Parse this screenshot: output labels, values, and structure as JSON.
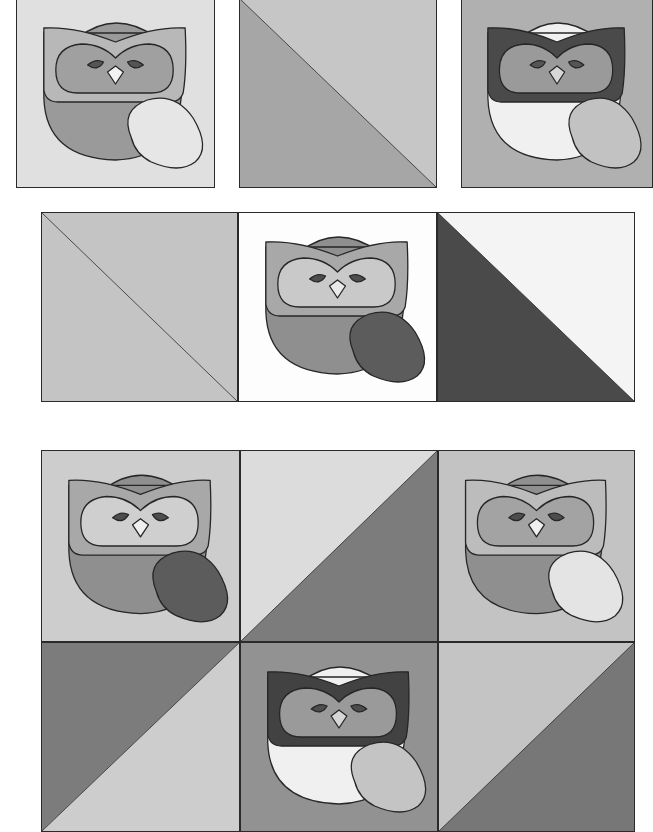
{
  "page": {
    "width": 651,
    "height": 825,
    "background": "#ffffff"
  },
  "palette": {
    "line": "#262626",
    "white": "#fbfbfb",
    "very_light": "#e4e4e4",
    "light": "#d0d0d0",
    "light_mid": "#bdbdbd",
    "mid": "#a9a9a9",
    "mid_dark": "#8e8e8e",
    "dark": "#6e6e6e",
    "darker": "#4a4a4a"
  },
  "sections": [
    {
      "name": "top-row",
      "blocks": [
        {
          "id": "top-1",
          "type": "owl",
          "x": 16,
          "y": -2,
          "w": 199,
          "h": 190,
          "bg": "#e0e0e0",
          "body": "#9a9a9a",
          "head_top": "#9a9a9a",
          "mask": "#b8b8b8",
          "face": "#a0a0a0",
          "eyes": "#555555",
          "beak": "#f2f2f2",
          "wing": "#e6e6e6"
        },
        {
          "id": "top-2",
          "type": "hst",
          "x": 239,
          "y": -2,
          "w": 198,
          "h": 190,
          "diagonal": "tl-br",
          "upper": "#c6c6c6",
          "lower": "#a6a6a6"
        },
        {
          "id": "top-3",
          "type": "owl",
          "x": 461,
          "y": -2,
          "w": 192,
          "h": 190,
          "bg": "#b0b0b0",
          "body": "#f0f0f0",
          "head_top": "#f0f0f0",
          "mask": "#4a4a4a",
          "face": "#9a9a9a",
          "eyes": "#555555",
          "beak": "#d8d8d8",
          "wing": "#c2c2c2"
        }
      ]
    },
    {
      "name": "middle-row",
      "blocks": [
        {
          "id": "mid-1",
          "type": "hst",
          "x": 41,
          "y": 212,
          "w": 197,
          "h": 190,
          "diagonal": "tl-br",
          "upper": "#c4c4c4",
          "lower": "#c4c4c4"
        },
        {
          "id": "mid-2",
          "type": "owl",
          "x": 238,
          "y": 212,
          "w": 199,
          "h": 190,
          "bg": "#fdfdfd",
          "body": "#8f8f8f",
          "head_top": "#8f8f8f",
          "mask": "#a8a8a8",
          "face": "#c9c9c9",
          "eyes": "#4d4d4d",
          "beak": "#eaeaea",
          "wing": "#5c5c5c"
        },
        {
          "id": "mid-3",
          "type": "hst",
          "x": 437,
          "y": 212,
          "w": 198,
          "h": 190,
          "diagonal": "tl-br",
          "upper": "#f4f4f4",
          "lower": "#4a4a4a"
        }
      ]
    },
    {
      "name": "bottom-grid",
      "blocks": [
        {
          "id": "bot-1",
          "type": "owl",
          "x": 41,
          "y": 450,
          "w": 199,
          "h": 192,
          "bg": "#cdcdcd",
          "body": "#8f8f8f",
          "head_top": "#8f8f8f",
          "mask": "#a8a8a8",
          "face": "#cfcfcf",
          "eyes": "#4d4d4d",
          "beak": "#efefef",
          "wing": "#5c5c5c"
        },
        {
          "id": "bot-2",
          "type": "hst",
          "x": 240,
          "y": 450,
          "w": 198,
          "h": 192,
          "diagonal": "bl-tr",
          "upper": "#dcdcdc",
          "lower": "#7c7c7c"
        },
        {
          "id": "bot-3",
          "type": "owl",
          "x": 438,
          "y": 450,
          "w": 197,
          "h": 192,
          "bg": "#c3c3c3",
          "body": "#8f8f8f",
          "head_top": "#8f8f8f",
          "mask": "#bcbcbc",
          "face": "#a3a3a3",
          "eyes": "#4d4d4d",
          "beak": "#efefef",
          "wing": "#e4e4e4"
        },
        {
          "id": "bot-4",
          "type": "hst",
          "x": 41,
          "y": 642,
          "w": 199,
          "h": 190,
          "diagonal": "bl-tr",
          "upper": "#7c7c7c",
          "lower": "#cdcdcd"
        },
        {
          "id": "bot-5",
          "type": "owl",
          "x": 240,
          "y": 642,
          "w": 198,
          "h": 190,
          "bg": "#929292",
          "body": "#f0f0f0",
          "head_top": "#f0f0f0",
          "mask": "#424242",
          "face": "#9a9a9a",
          "eyes": "#4d4d4d",
          "beak": "#d6d6d6",
          "wing": "#c4c4c4"
        },
        {
          "id": "bot-6",
          "type": "hst",
          "x": 438,
          "y": 642,
          "w": 197,
          "h": 190,
          "diagonal": "bl-tr",
          "upper": "#c4c4c4",
          "lower": "#777777"
        }
      ]
    }
  ]
}
